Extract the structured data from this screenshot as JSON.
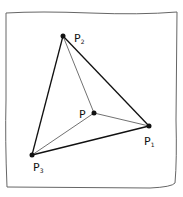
{
  "diagram": {
    "type": "triangle-with-interior-point",
    "style": "hand-drawn sketch on paper",
    "points": {
      "P": {
        "label": "P",
        "sub": ""
      },
      "P1": {
        "label": "P",
        "sub": "1"
      },
      "P2": {
        "label": "P",
        "sub": "2"
      },
      "P3": {
        "label": "P",
        "sub": "3"
      }
    },
    "edges": [
      {
        "from": "P1",
        "to": "P2",
        "weight": "thick"
      },
      {
        "from": "P2",
        "to": "P3",
        "weight": "thick"
      },
      {
        "from": "P3",
        "to": "P1",
        "weight": "thick"
      },
      {
        "from": "P",
        "to": "P1",
        "weight": "thin"
      },
      {
        "from": "P",
        "to": "P2",
        "weight": "thin"
      },
      {
        "from": "P",
        "to": "P3",
        "weight": "thin"
      }
    ],
    "colors": {
      "ink": "#111111",
      "paper": "#ffffff",
      "frame": "#555555"
    }
  }
}
